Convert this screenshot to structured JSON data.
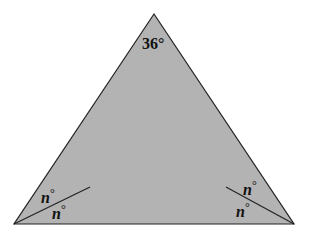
{
  "diagram": {
    "type": "triangle",
    "fill_color": "#b3b3b3",
    "stroke_color": "#222222",
    "vertices": {
      "apex": [
        154,
        14
      ],
      "bottom_left": [
        14,
        224
      ],
      "bottom_right": [
        294,
        224
      ]
    },
    "apex_angle_label": "36°",
    "left_angle": {
      "upper_label_var": "n",
      "upper_label_deg": "°",
      "lower_label_var": "n",
      "lower_label_deg": "°",
      "bisector_end": [
        90,
        187
      ]
    },
    "right_angle": {
      "upper_label_var": "n",
      "upper_label_deg": "°",
      "lower_label_var": "n",
      "lower_label_deg": "°",
      "bisector_end": [
        226,
        187
      ]
    }
  }
}
